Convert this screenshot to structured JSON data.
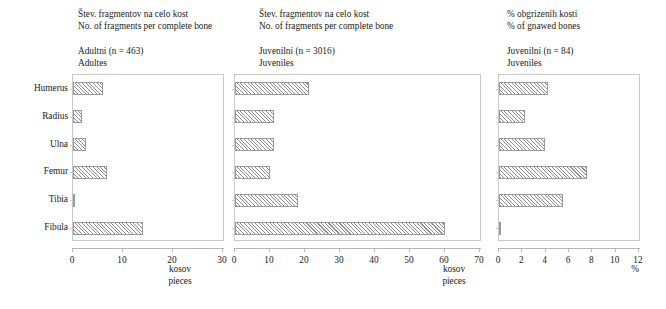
{
  "chart_data": [
    {
      "type": "bar",
      "orientation": "horizontal",
      "title": "Adultni (n = 463)",
      "subtitle": "Adultes",
      "caption": "Štev. fragmentov na celo kost",
      "caption_en": "No. of fragments per complete bone",
      "categories": [
        "Humerus",
        "Radius",
        "Ulna",
        "Femur",
        "Tibia",
        "Fibula"
      ],
      "values": [
        6.0,
        1.7,
        2.6,
        6.8,
        0.4,
        14.0
      ],
      "xlabel": "kosov",
      "xlabel_en": "pieces",
      "ylabel": "",
      "xlim": [
        0,
        30
      ],
      "xticks": [
        0,
        10,
        20,
        30
      ],
      "grid": false,
      "legend": "none"
    },
    {
      "type": "bar",
      "orientation": "horizontal",
      "title": "Juvenilni (n = 3016)",
      "subtitle": "Juveniles",
      "caption": "Štev. fragmentov na celo kost",
      "caption_en": "No. of fragments per complete bone",
      "categories": [
        "Humerus",
        "Radius",
        "Ulna",
        "Femur",
        "Tibia",
        "Fibula"
      ],
      "values": [
        21.0,
        11.0,
        11.0,
        10.0,
        18.0,
        60.0
      ],
      "xlabel": "kosov",
      "xlabel_en": "pieces",
      "ylabel": "",
      "xlim": [
        0,
        70
      ],
      "xticks": [
        0,
        10,
        20,
        30,
        40,
        50,
        60,
        70
      ],
      "grid": false,
      "legend": "none"
    },
    {
      "type": "bar",
      "orientation": "horizontal",
      "title": "Juvenilni (n = 84)",
      "subtitle": "Juveniles",
      "caption": "% obgrizenih kosti",
      "caption_en": "% of gnawed bones",
      "categories": [
        "Humerus",
        "Radius",
        "Ulna",
        "Femur",
        "Tibia",
        "Fibula"
      ],
      "values": [
        4.2,
        2.2,
        3.9,
        7.5,
        5.5,
        0.1
      ],
      "xlabel": "%",
      "xlabel_en": "",
      "ylabel": "",
      "xlim": [
        0,
        12
      ],
      "xticks": [
        0,
        2,
        4,
        6,
        8,
        10,
        12
      ],
      "grid": false,
      "legend": "none"
    }
  ],
  "panels": [
    {
      "caption_sl": "Štev. fragmentov na celo kost",
      "caption_en": "No. of fragments per complete bone",
      "group_sl": "Adultni (n = 463)",
      "group_en": "Adultes",
      "axis_title_sl": "kosov",
      "axis_title_en": "pieces"
    },
    {
      "caption_sl": "Štev. fragmentov na celo kost",
      "caption_en": "No. of fragments per complete bone",
      "group_sl": "Juvenilni (n = 3016)",
      "group_en": "Juveniles",
      "axis_title_sl": "kosov",
      "axis_title_en": "pieces"
    },
    {
      "caption_sl": "% obgrizenih kosti",
      "caption_en": "% of gnawed bones",
      "group_sl": "Juvenilni (n = 84)",
      "group_en": "Juveniles",
      "axis_title_sl": "%",
      "axis_title_en": ""
    }
  ],
  "bone_labels": [
    "Humerus",
    "Radius",
    "Ulna",
    "Femur",
    "Tibia",
    "Fibula"
  ],
  "colors": {
    "bar_hatch": "#8e8e8e",
    "bar_fill": "#ffffff",
    "bar_edge": "#9a9a9a",
    "axis": "#b5b5b5",
    "frame": "#c9c9c9",
    "text": "#1a1a1a",
    "background": "#ffffff"
  }
}
